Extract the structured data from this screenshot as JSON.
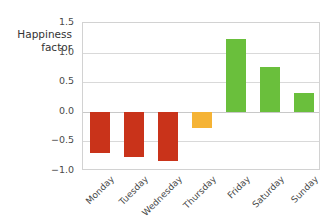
{
  "chart_data": {
    "type": "bar",
    "title": "",
    "subtitle": "",
    "xlabel": "",
    "ylabel": "Happiness\nfactor",
    "categories": [
      "Monday",
      "Tuesday",
      "Wednesday",
      "Thursday",
      "Friday",
      "Saturday",
      "Sunday"
    ],
    "values": [
      -0.69,
      -0.76,
      -0.83,
      -0.27,
      1.23,
      0.76,
      0.31
    ],
    "bar_colors": [
      "#c9331a",
      "#c9331a",
      "#c9331a",
      "#f5b335",
      "#6abf3c",
      "#6abf3c",
      "#6abf3c"
    ],
    "ylim": [
      -1.0,
      1.5
    ],
    "yticks": [
      "1.5",
      "1.0",
      "0.5",
      "0.0",
      "−0.5",
      "−1.0"
    ],
    "ytick_values": [
      1.5,
      1.0,
      0.5,
      0.0,
      -0.5,
      -1.0
    ],
    "grid": true,
    "grid_axis": "y",
    "legend": "none",
    "xtick_rotation": -45
  },
  "colors": {
    "negative": "#c9331a",
    "neutral": "#f5b335",
    "positive": "#6abf3c",
    "gridline": "#d9d9d9",
    "frame": "#d2d2d2",
    "text": "#4a4a4a",
    "background": "#ffffff"
  }
}
